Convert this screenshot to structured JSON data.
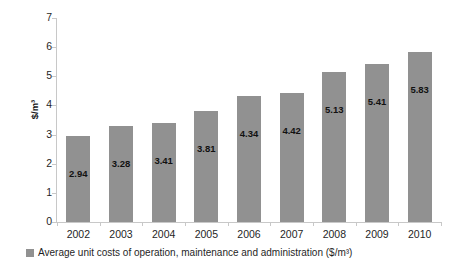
{
  "chart_data": {
    "type": "bar",
    "title": "",
    "subtitle": "",
    "xlabel": "",
    "ylabel": "$/m³",
    "categories": [
      "2002",
      "2003",
      "2004",
      "2005",
      "2006",
      "2007",
      "2008",
      "2009",
      "2010"
    ],
    "values": [
      2.94,
      3.28,
      3.41,
      3.81,
      4.34,
      4.42,
      5.13,
      5.41,
      5.83
    ],
    "data_labels": [
      "2.94",
      "3.28",
      "3.41",
      "3.81",
      "4.34",
      "4.42",
      "5.13",
      "5.41",
      "5.83"
    ],
    "series": [
      {
        "name": "Average unit costs of operation, maintenance and administration ($/m³)",
        "values": [
          2.94,
          3.28,
          3.41,
          3.81,
          4.34,
          4.42,
          5.13,
          5.41,
          5.83
        ],
        "color": "#919191"
      }
    ],
    "ylim": [
      0,
      7
    ],
    "ytick_step": 1,
    "ytick_labels": [
      "7",
      "6",
      "5",
      "4",
      "3",
      "2",
      "1",
      "0"
    ],
    "grid": false,
    "legend_position": "bottom",
    "bar_color": "#919191",
    "axis_color": "#c8c8c8",
    "background": "#ffffff"
  },
  "legend": {
    "marker_name": "legend-color-swatch",
    "label": "Average unit costs of operation, maintenance and administration ($/m³)"
  }
}
